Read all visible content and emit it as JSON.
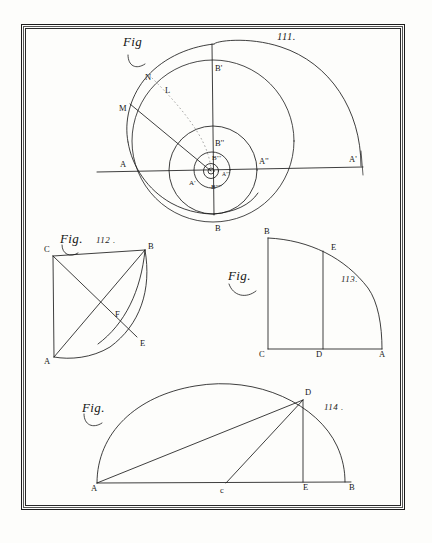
{
  "plate": {
    "title": "Engraved geometry plate with four figures",
    "background_color": "#fdfdfb",
    "ink_color": "#1c1c1c",
    "frame": {
      "style": "double-ruled border",
      "color": "#1c1c1c"
    }
  },
  "figures": [
    {
      "id": "fig-111",
      "fig_word": "Fig",
      "number": "111.",
      "kind": "logarithmic-spiral",
      "labels": [
        {
          "name": "label-b-prime",
          "text": "B'",
          "x": 215,
          "y": 64
        },
        {
          "name": "label-n",
          "text": "N",
          "x": 145,
          "y": 73
        },
        {
          "name": "label-l",
          "text": "L",
          "x": 165,
          "y": 86
        },
        {
          "name": "label-m",
          "text": "M",
          "x": 119,
          "y": 104
        },
        {
          "name": "label-b-double-prime",
          "text": "B''",
          "x": 215,
          "y": 139
        },
        {
          "name": "label-b-triple-prime",
          "text": "B'''",
          "x": 212,
          "y": 155
        },
        {
          "name": "label-a-left",
          "text": "A",
          "x": 120,
          "y": 160
        },
        {
          "name": "label-a-double-prime",
          "text": "A''",
          "x": 259,
          "y": 157
        },
        {
          "name": "label-a-far-right",
          "text": "A'",
          "x": 349,
          "y": 157
        },
        {
          "name": "label-a-prime-inner",
          "text": "A'",
          "x": 189,
          "y": 180
        },
        {
          "name": "label-a-triple-prime",
          "text": "A'''",
          "x": 223,
          "y": 173
        },
        {
          "name": "label-b-quad-prime",
          "text": "B''''",
          "x": 212,
          "y": 184
        },
        {
          "name": "label-b-bottom",
          "text": "B",
          "x": 215,
          "y": 225
        }
      ]
    },
    {
      "id": "fig-112",
      "fig_word": "Fig.",
      "number": "112 .",
      "kind": "quadrant-with-chords",
      "labels": [
        {
          "name": "label-c",
          "text": "C",
          "x": 44,
          "y": 249
        },
        {
          "name": "label-b",
          "text": "B",
          "x": 148,
          "y": 248
        },
        {
          "name": "label-f",
          "text": "F",
          "x": 115,
          "y": 313
        },
        {
          "name": "label-e",
          "text": "E",
          "x": 140,
          "y": 342
        },
        {
          "name": "label-a",
          "text": "A",
          "x": 44,
          "y": 361
        }
      ]
    },
    {
      "id": "fig-113",
      "fig_word": "Fig.",
      "number": "113.",
      "kind": "quarter-circle-with-ordinate",
      "labels": [
        {
          "name": "label-b",
          "text": "B",
          "x": 264,
          "y": 231
        },
        {
          "name": "label-e",
          "text": "E",
          "x": 332,
          "y": 246
        },
        {
          "name": "label-c",
          "text": "C",
          "x": 261,
          "y": 351
        },
        {
          "name": "label-d",
          "text": "D",
          "x": 316,
          "y": 351
        },
        {
          "name": "label-a",
          "text": "A",
          "x": 381,
          "y": 351
        }
      ]
    },
    {
      "id": "fig-114",
      "fig_word": "Fig.",
      "number": "114 .",
      "kind": "semicircle-with-inscribed-lines",
      "labels": [
        {
          "name": "label-d",
          "text": "D",
          "x": 305,
          "y": 392
        },
        {
          "name": "label-a",
          "text": "A",
          "x": 92,
          "y": 487
        },
        {
          "name": "label-c",
          "text": "c",
          "x": 221,
          "y": 488
        },
        {
          "name": "label-e",
          "text": "E",
          "x": 303,
          "y": 485
        },
        {
          "name": "label-b",
          "text": "B",
          "x": 350,
          "y": 485
        }
      ]
    }
  ]
}
